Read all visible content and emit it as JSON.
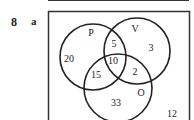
{
  "question": {
    "number": "8",
    "part": "a"
  },
  "venn": {
    "universal_label": "",
    "sets": [
      {
        "name": "P",
        "cx": 93,
        "cy": 57,
        "r": 33,
        "label_x": 91,
        "label_y": 36
      },
      {
        "name": "V",
        "cx": 137,
        "cy": 51,
        "r": 33,
        "label_x": 135,
        "label_y": 32
      },
      {
        "name": "O",
        "cx": 118,
        "cy": 88,
        "r": 34,
        "label_x": 141,
        "label_y": 96
      }
    ],
    "regions": [
      {
        "id": "P_only",
        "value": "20",
        "x": 69,
        "y": 62
      },
      {
        "id": "P_and_V_only",
        "value": "5",
        "x": 114,
        "y": 47
      },
      {
        "id": "V_only",
        "value": "3",
        "x": 151,
        "y": 51
      },
      {
        "id": "P_and_V_and_O",
        "value": "10",
        "x": 113,
        "y": 64
      },
      {
        "id": "P_and_O_only",
        "value": "15",
        "x": 96,
        "y": 78
      },
      {
        "id": "V_and_O_only",
        "value": "2",
        "x": 135,
        "y": 75
      },
      {
        "id": "O_only",
        "value": "33",
        "x": 116,
        "y": 106
      },
      {
        "id": "outside",
        "value": "12",
        "x": 172,
        "y": 117
      }
    ]
  }
}
